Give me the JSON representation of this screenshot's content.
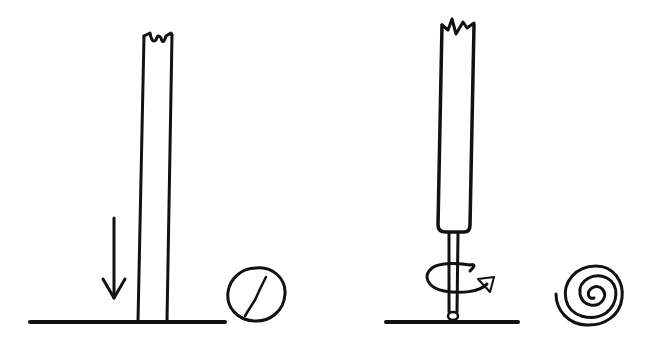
{
  "figure": {
    "background": "#ffffff",
    "ink_color": "#111111",
    "panels": [
      {
        "id": "left",
        "description": "Straight rod pressed down onto a surface, producing a flat round disc with a crack",
        "elements": [
          "surface-line",
          "rod",
          "down-arrow",
          "cracked-disc"
        ]
      },
      {
        "id": "right",
        "description": "Handle with thin rotating tip on a surface, producing a spiral",
        "elements": [
          "surface-line",
          "handle",
          "rotating-tip",
          "rotation-arrow",
          "spiral"
        ]
      }
    ]
  }
}
